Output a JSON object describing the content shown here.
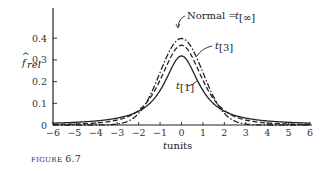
{
  "figure": {
    "caption_prefix": "FIGURE",
    "caption_number": "6.7"
  },
  "chart_data": {
    "type": "line",
    "title": "",
    "xlabel": "t units",
    "ylabel": "f̂rel",
    "xlim": [
      -6,
      6
    ],
    "ylim": [
      0,
      0.45
    ],
    "x_ticks": [
      "−6",
      "−5",
      "−4",
      "−3",
      "−2",
      "−1",
      "0",
      "1",
      "2",
      "3",
      "4",
      "5",
      "6"
    ],
    "y_ticks": [
      "0",
      "0.1",
      "0.2",
      "0.3",
      "0.4"
    ],
    "grid": false,
    "legend": "annotations",
    "series": [
      {
        "name": "Normal = t[∞]",
        "style": "dash-dot",
        "peak": 0.399,
        "x": [
          -3,
          -2,
          -1,
          0,
          1,
          2,
          3
        ],
        "values": [
          0.004,
          0.054,
          0.242,
          0.399,
          0.242,
          0.054,
          0.004
        ]
      },
      {
        "name": "t[3]",
        "style": "dashed",
        "peak": 0.368,
        "x": [
          -6,
          -4,
          -3,
          -2,
          -1,
          0,
          1,
          2,
          3,
          4,
          6
        ],
        "values": [
          0.004,
          0.009,
          0.023,
          0.068,
          0.207,
          0.368,
          0.207,
          0.068,
          0.023,
          0.009,
          0.004
        ]
      },
      {
        "name": "t[1]",
        "style": "solid",
        "peak": 0.318,
        "x": [
          -6,
          -4,
          -3,
          -2,
          -1,
          0,
          1,
          2,
          3,
          4,
          6
        ],
        "values": [
          0.009,
          0.019,
          0.032,
          0.064,
          0.159,
          0.318,
          0.159,
          0.064,
          0.032,
          0.019,
          0.009
        ]
      }
    ],
    "annotations": [
      {
        "text": "Normal = t",
        "sub": "[∞]"
      },
      {
        "text": "t",
        "sub": "[3]"
      },
      {
        "text": "t",
        "sub": "[1]"
      }
    ]
  },
  "labels": {
    "normal": "Normal = ",
    "normal_t": "t",
    "normal_sub": "[∞]",
    "t3": "t",
    "t3_sub": "[3]",
    "t1": "t",
    "t1_sub": "[1]",
    "ylabel_f": "f",
    "ylabel_sub": "rel",
    "ylabel_hat": "^",
    "xlabel_t": "t",
    "xlabel_units": " units"
  }
}
